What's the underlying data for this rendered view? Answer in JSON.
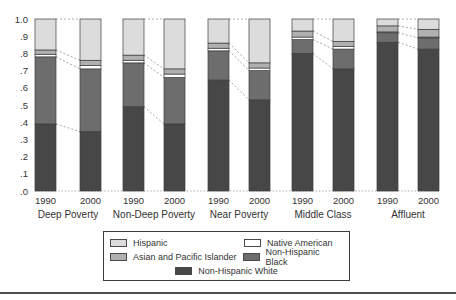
{
  "figure": {
    "background": "#ffffff",
    "text_color": "#333333",
    "rule_color": "#4f4f4f"
  },
  "chart_data": {
    "type": "bar",
    "subtype": "stacked-proportion",
    "title": "",
    "xlabel": "",
    "ylabel": "",
    "ylim": [
      0,
      1
    ],
    "grid": "off",
    "groups": [
      "Deep Poverty",
      "Non-Deep Poverty",
      "Near Poverty",
      "Middle Class",
      "Affluent"
    ],
    "years": [
      "1990",
      "2000"
    ],
    "y_ticks": [
      {
        "label": "1.0",
        "value": 1.0
      },
      {
        "label": ".9",
        "value": 0.9
      },
      {
        "label": ".8",
        "value": 0.8
      },
      {
        "label": ".7",
        "value": 0.7
      },
      {
        "label": ".6",
        "value": 0.6
      },
      {
        "label": ".5",
        "value": 0.5
      },
      {
        "label": ".4",
        "value": 0.4
      },
      {
        "label": ".3",
        "value": 0.3
      },
      {
        "label": ".2",
        "value": 0.2
      },
      {
        "label": ".1",
        "value": 0.1
      },
      {
        "label": ".0",
        "value": 0.0
      }
    ],
    "series": [
      {
        "name": "Non-Hispanic White",
        "color": "#474747",
        "values": [
          [
            0.39,
            0.345
          ],
          [
            0.49,
            0.39
          ],
          [
            0.645,
            0.53
          ],
          [
            0.8,
            0.71
          ],
          [
            0.865,
            0.825
          ]
        ]
      },
      {
        "name": "Non-Hispanic Black",
        "color": "#6d6d6d",
        "values": [
          [
            0.39,
            0.365
          ],
          [
            0.255,
            0.27
          ],
          [
            0.17,
            0.17
          ],
          [
            0.08,
            0.115
          ],
          [
            0.055,
            0.065
          ]
        ]
      },
      {
        "name": "Native American",
        "color": "#ffffff",
        "values": [
          [
            0.015,
            0.02
          ],
          [
            0.015,
            0.02
          ],
          [
            0.015,
            0.015
          ],
          [
            0.015,
            0.015
          ],
          [
            0.005,
            0.005
          ]
        ]
      },
      {
        "name": "Asian and Pacific Islander",
        "color": "#b0b0b0",
        "values": [
          [
            0.025,
            0.03
          ],
          [
            0.03,
            0.03
          ],
          [
            0.03,
            0.03
          ],
          [
            0.035,
            0.03
          ],
          [
            0.035,
            0.045
          ]
        ]
      },
      {
        "name": "Hispanic",
        "color": "#dcdcdc",
        "values": [
          [
            0.18,
            0.24
          ],
          [
            0.21,
            0.29
          ],
          [
            0.14,
            0.255
          ],
          [
            0.07,
            0.13
          ],
          [
            0.04,
            0.06
          ]
        ]
      }
    ],
    "legend": {
      "position": "bottom",
      "items": [
        {
          "label": "Hispanic",
          "color": "#dcdcdc"
        },
        {
          "label": "Native American",
          "color": "#ffffff"
        },
        {
          "label": "Asian and Pacific Islander",
          "color": "#b0b0b0"
        },
        {
          "label": "Non-Hispanic Black",
          "color": "#6d6d6d"
        },
        {
          "label": "Non-Hispanic White",
          "color": "#474747"
        }
      ]
    }
  }
}
